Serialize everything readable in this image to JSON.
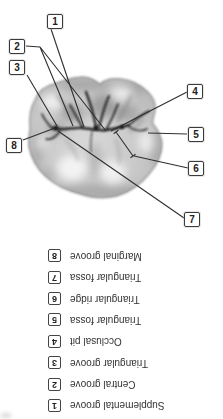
{
  "figure": {
    "callouts": [
      {
        "num": "1"
      },
      {
        "num": "2"
      },
      {
        "num": "3"
      },
      {
        "num": "4"
      },
      {
        "num": "5"
      },
      {
        "num": "6"
      },
      {
        "num": "7"
      },
      {
        "num": "8"
      }
    ]
  },
  "legend": {
    "rotation_deg": 180,
    "items": [
      {
        "num": "1",
        "label": "Supplemental groove"
      },
      {
        "num": "2",
        "label": "Central groove"
      },
      {
        "num": "3",
        "label": "Triangular groove"
      },
      {
        "num": "4",
        "label": "Occlusal pit"
      },
      {
        "num": "5",
        "label": "Triangular fossa"
      },
      {
        "num": "6",
        "label": "Triangular ridge"
      },
      {
        "num": "7",
        "label": "Triangular fossa"
      },
      {
        "num": "8",
        "label": "Marginal groove"
      }
    ]
  },
  "colors": {
    "background": "#ffffff",
    "leader_line": "#2f2f2f",
    "box_border": "#3a3a3a",
    "legend_text": "#333333",
    "tooth_base": "#c6c6c6",
    "tooth_groove": "#1c1c1c"
  }
}
